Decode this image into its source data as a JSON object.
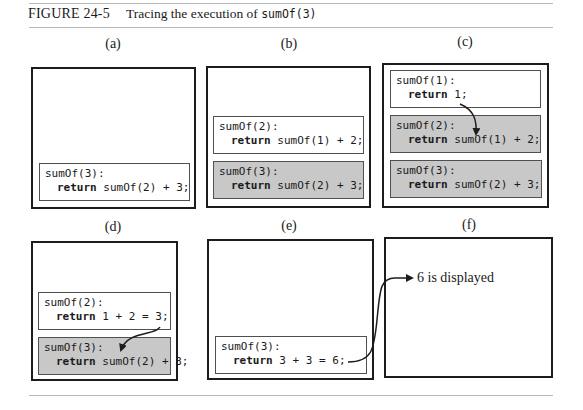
{
  "figure": {
    "number": "FIGURE 24-5",
    "caption_prefix": "Tracing the execution of ",
    "caption_code": "sumOf(3)"
  },
  "panels": [
    {
      "label": "(a)",
      "frames": [
        {
          "header": "sumOf(3):",
          "ret_kw": "return",
          "ret_expr": " sumOf(2) + 3;",
          "shaded": false
        }
      ]
    },
    {
      "label": "(b)",
      "frames": [
        {
          "header": "sumOf(2):",
          "ret_kw": "return",
          "ret_expr": " sumOf(1) + 2;",
          "shaded": false
        },
        {
          "header": "sumOf(3):",
          "ret_kw": "return",
          "ret_expr": " sumOf(2) + 3;",
          "shaded": true
        }
      ]
    },
    {
      "label": "(c)",
      "frames": [
        {
          "header": "sumOf(1):",
          "ret_kw": "return",
          "ret_expr": " 1;",
          "shaded": false
        },
        {
          "header": "sumOf(2):",
          "ret_kw": "return",
          "ret_expr": " sumOf(1) + 2;",
          "shaded": true
        },
        {
          "header": "sumOf(3):",
          "ret_kw": "return",
          "ret_expr": " sumOf(2) + 3;",
          "shaded": true
        }
      ]
    },
    {
      "label": "(d)",
      "frames": [
        {
          "header": "sumOf(2):",
          "ret_kw": "return",
          "ret_expr": " 1 + 2 = 3;",
          "shaded": false
        },
        {
          "header": "sumOf(3):",
          "ret_kw": "return",
          "ret_expr": " sumOf(2) + 3;",
          "shaded": true
        }
      ]
    },
    {
      "label": "(e)",
      "frames": [
        {
          "header": "sumOf(3):",
          "ret_kw": "return",
          "ret_expr": " 3 + 3 = 6;",
          "shaded": false
        }
      ]
    },
    {
      "label": "(f)",
      "frames": [],
      "output_text": "6 is displayed"
    }
  ],
  "colors": {
    "panel_border": "#1c1c1c",
    "frame_border": "#505050",
    "shaded_frame_fill": "#c8c8c8",
    "rule": "#b8b8b8"
  }
}
